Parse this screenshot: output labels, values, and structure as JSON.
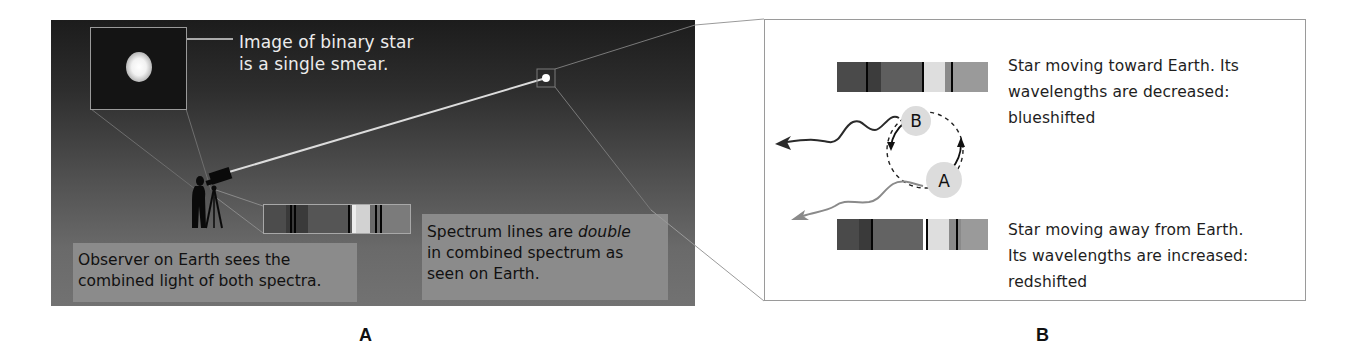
{
  "panel_a": {
    "figure_label": "A",
    "smear_caption_line1": "Image of binary star",
    "smear_caption_line2": "is a single smear.",
    "observer_label_line1": "Observer on Earth sees the",
    "observer_label_line2": "combined light of both spectra.",
    "spectrum_label_line1_pre": "Spectrum lines are ",
    "spectrum_label_line1_ital": "double",
    "spectrum_label_line2": "in combined spectrum as",
    "spectrum_label_line3": "seen on Earth.",
    "icons": [
      "telescope-icon",
      "observer-silhouette-icon",
      "star-icon"
    ]
  },
  "panel_b": {
    "figure_label": "B",
    "blueshift_caption_line1": "Star moving toward Earth. Its",
    "blueshift_caption_line2": "wavelengths are decreased:",
    "blueshift_caption_line3": "blueshifted",
    "redshift_caption_line1": "Star moving away from Earth.",
    "redshift_caption_line2": "Its wavelengths are increased:",
    "redshift_caption_line3": "redshifted",
    "star_b_label": "B",
    "star_a_label": "A"
  },
  "colors": {
    "panel_a_top": "#1c1c1c",
    "panel_a_bottom": "#727272",
    "label_box": "#8b8b8b",
    "panel_b_border": "#9a9a9a",
    "star_disc": "#dcdcdc",
    "blue_wave": "#2a2a2a",
    "red_wave": "#8a8a8a"
  }
}
